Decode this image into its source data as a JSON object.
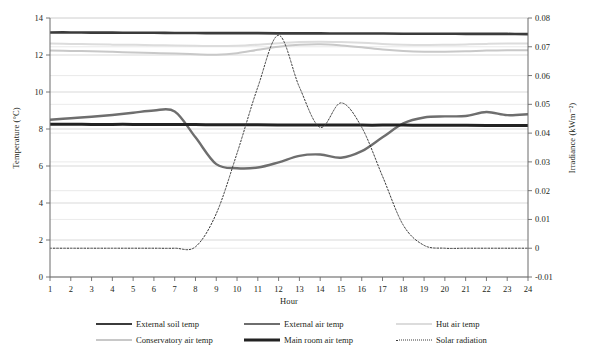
{
  "chart_data": {
    "type": "line",
    "title": "",
    "xlabel": "Hour",
    "ylabel": "Temperature (°C)",
    "y2label": "Irradiance (kWm⁻²)",
    "x": [
      1,
      2,
      3,
      4,
      5,
      6,
      7,
      8,
      9,
      10,
      11,
      12,
      13,
      14,
      15,
      16,
      17,
      18,
      19,
      20,
      21,
      22,
      23,
      24
    ],
    "xlim": [
      1,
      24
    ],
    "xticks": [
      "1",
      "2",
      "3",
      "4",
      "5",
      "6",
      "7",
      "8",
      "9",
      "10",
      "11",
      "12",
      "13",
      "14",
      "15",
      "16",
      "17",
      "18",
      "19",
      "20",
      "21",
      "22",
      "23",
      "24"
    ],
    "ylim": [
      0,
      14
    ],
    "yticks": [
      "0",
      "2",
      "4",
      "6",
      "8",
      "10",
      "12",
      "14"
    ],
    "y2lim": [
      -0.01,
      0.08
    ],
    "y2ticks": [
      "-0.01",
      "0",
      "0.01",
      "0.02",
      "0.03",
      "0.04",
      "0.05",
      "0.06",
      "0.07",
      "0.08"
    ],
    "grid": "horizontal",
    "legend_position": "bottom",
    "series": [
      {
        "name": "External soil temp",
        "axis": "left",
        "color": "#3b3b3b",
        "width": 2.6,
        "dash": "none",
        "values": [
          13.22,
          13.22,
          13.21,
          13.21,
          13.2,
          13.2,
          13.19,
          13.19,
          13.18,
          13.18,
          13.18,
          13.17,
          13.17,
          13.17,
          13.16,
          13.16,
          13.16,
          13.15,
          13.15,
          13.15,
          13.14,
          13.14,
          13.14,
          13.13
        ]
      },
      {
        "name": "External air temp",
        "axis": "left",
        "color": "#6e6e6e",
        "width": 2.4,
        "dash": "none",
        "values": [
          8.5,
          8.58,
          8.66,
          8.76,
          8.88,
          9.0,
          8.95,
          7.55,
          6.1,
          5.88,
          5.92,
          6.2,
          6.55,
          6.62,
          6.45,
          6.8,
          7.55,
          8.3,
          8.62,
          8.68,
          8.7,
          8.92,
          8.75,
          8.8
        ]
      },
      {
        "name": "Hut air temp",
        "axis": "left",
        "color": "#dcdcdc",
        "width": 2.0,
        "dash": "none",
        "values": [
          12.62,
          12.6,
          12.58,
          12.56,
          12.55,
          12.53,
          12.52,
          12.5,
          12.48,
          12.5,
          12.56,
          12.64,
          12.7,
          12.72,
          12.7,
          12.66,
          12.6,
          12.56,
          12.54,
          12.55,
          12.57,
          12.6,
          12.62,
          12.62
        ]
      },
      {
        "name": "Conservatory air temp",
        "axis": "left",
        "color": "#c8c8c8",
        "width": 2.0,
        "dash": "none",
        "values": [
          12.25,
          12.22,
          12.2,
          12.17,
          12.14,
          12.11,
          12.08,
          12.04,
          12.02,
          12.1,
          12.28,
          12.45,
          12.55,
          12.58,
          12.52,
          12.42,
          12.3,
          12.22,
          12.18,
          12.18,
          12.2,
          12.24,
          12.26,
          12.26
        ]
      },
      {
        "name": "Main room air temp",
        "axis": "left",
        "color": "#222222",
        "width": 3.0,
        "dash": "none",
        "values": [
          8.26,
          8.26,
          8.25,
          8.25,
          8.25,
          8.24,
          8.24,
          8.24,
          8.23,
          8.23,
          8.23,
          8.22,
          8.22,
          8.22,
          8.22,
          8.21,
          8.21,
          8.21,
          8.2,
          8.2,
          8.2,
          8.19,
          8.19,
          8.19
        ]
      },
      {
        "name": "Solar radiation",
        "axis": "right",
        "color": "#3a3a3a",
        "width": 1.0,
        "dash": "dotted",
        "values": [
          0.0,
          0.0,
          0.0,
          0.0,
          0.0,
          0.0,
          0.0,
          0.0005,
          0.012,
          0.033,
          0.056,
          0.074,
          0.056,
          0.042,
          0.0505,
          0.042,
          0.025,
          0.008,
          0.001,
          0.0,
          0.0,
          0.0,
          0.0,
          0.0
        ]
      }
    ]
  },
  "legend": {
    "items": [
      {
        "label": "External soil temp"
      },
      {
        "label": "External air temp"
      },
      {
        "label": "Hut air temp"
      },
      {
        "label": "Conservatory air temp"
      },
      {
        "label": "Main room air temp"
      },
      {
        "label": "Solar radiation"
      }
    ]
  }
}
